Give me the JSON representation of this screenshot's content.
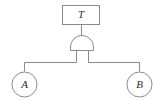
{
  "diagram": {
    "type": "fault-tree",
    "title": "",
    "canvas": {
      "width": 164,
      "height": 101,
      "background": "#ffffff"
    },
    "stroke_color": "#8a8a8a",
    "text_color": "#2b2b2b",
    "top_event": {
      "id": "T",
      "label": "T",
      "shape": "rectangle",
      "x": 62,
      "y": 5,
      "width": 38,
      "height": 20
    },
    "gate": {
      "id": "G1",
      "type": "AND",
      "label": "",
      "shape": "and-gate-dome",
      "cx": 82,
      "top_y": 36,
      "bottom_y": 50,
      "left_x": 70,
      "right_x": 94
    },
    "basic_events": [
      {
        "id": "A",
        "label": "A",
        "shape": "circle",
        "cx": 24,
        "cy": 84,
        "r": 13
      },
      {
        "id": "B",
        "label": "B",
        "shape": "circle",
        "cx": 139,
        "cy": 84,
        "r": 13
      }
    ],
    "connectors": {
      "bus_y": 62,
      "gate_leg_left_x": 76,
      "gate_leg_right_x": 88,
      "edges": [
        {
          "from": "T",
          "to": "G1"
        },
        {
          "from": "G1",
          "to": "A"
        },
        {
          "from": "G1",
          "to": "B"
        }
      ]
    }
  }
}
